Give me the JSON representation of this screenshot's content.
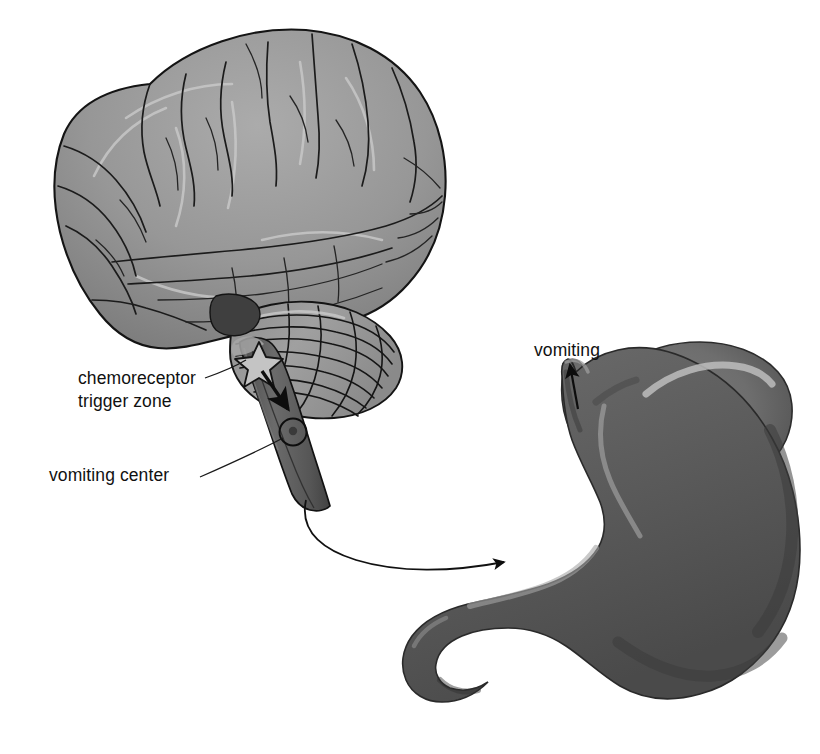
{
  "figure": {
    "title": "",
    "background_color": "#ffffff",
    "width": 820,
    "height": 754
  },
  "labels": [
    {
      "name": "chemoreceptor-trigger-zone",
      "line1": "chemoreceptor",
      "line2": "trigger zone",
      "x": 78,
      "y": 384
    },
    {
      "name": "vomiting-center",
      "line1": "vomiting center",
      "x": 49,
      "y": 481
    },
    {
      "name": "vomiting",
      "line1": "vomiting",
      "x": 534,
      "y": 356
    }
  ],
  "structures": [
    {
      "name": "cerebrum",
      "label": "cerebrum",
      "fill": "#8e8e8e"
    },
    {
      "name": "cerebellum",
      "label": "cerebellum",
      "fill": "#9a9a9a"
    },
    {
      "name": "brainstem",
      "label": "brainstem",
      "fill": "#5e5e5e"
    },
    {
      "name": "stomach",
      "label": "stomach",
      "fill": "#6f6f6f"
    },
    {
      "name": "esophagus",
      "label": "esophagus",
      "fill": "#6a6a6a"
    },
    {
      "name": "duodenum",
      "label": "duodenum",
      "fill": "#686868"
    }
  ],
  "markers": [
    {
      "name": "ctz-star-marker",
      "shape": "star",
      "fill": "#c4c4c4",
      "stroke": "#151515",
      "cx": 259,
      "cy": 362
    },
    {
      "name": "vomiting-center-circle-marker",
      "shape": "circle",
      "fill": "none",
      "stroke": "#0f0f0f",
      "cx": 293,
      "cy": 432,
      "r": 13
    }
  ],
  "arrows": [
    {
      "name": "ctz-to-vomiting-center-arrow",
      "from": "chemoreceptor trigger zone",
      "to": "vomiting center",
      "color": "#0d0d0d"
    },
    {
      "name": "vagal-efferent-arrow",
      "from": "vomiting center",
      "to": "stomach",
      "color": "#111111"
    },
    {
      "name": "vomiting-output-arrow",
      "from": "stomach",
      "to": "vomiting",
      "color": "#0d0d0d"
    }
  ],
  "colors": {
    "background": "#ffffff",
    "cerebrum_light": "#a2a2a2",
    "cerebrum_dark": "#7c7c7c",
    "cerebellum": "#9b9b9b",
    "brainstem": "#5c5c5c",
    "stomach_body": "#717171",
    "stomach_shadow": "#4d4d4d",
    "stomach_highlight": "#b9b9b9",
    "outline": "#151515",
    "text": "#111111"
  }
}
